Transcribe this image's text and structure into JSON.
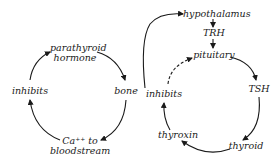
{
  "diagrams": [
    {
      "name": "parathyroid-cycle",
      "nodes": [
        {
          "id": "parathyroid_hormone",
          "line1": "parathyroid",
          "line2": "hormone"
        },
        {
          "id": "bone",
          "line1": "bone"
        },
        {
          "id": "ca_to_bloodstream",
          "line1": "Ca⁺⁺ to",
          "line2": "bloodstream"
        },
        {
          "id": "inhibits",
          "line1": "inhibits"
        }
      ],
      "edges": [
        [
          "parathyroid_hormone",
          "bone"
        ],
        [
          "bone",
          "ca_to_bloodstream"
        ],
        [
          "ca_to_bloodstream",
          "inhibits"
        ],
        [
          "inhibits",
          "parathyroid_hormone"
        ]
      ]
    },
    {
      "name": "thyroid-cycle",
      "nodes": [
        {
          "id": "hypothalamus",
          "line1": "hypothalamus"
        },
        {
          "id": "trh",
          "line1": "TRH"
        },
        {
          "id": "pituitary",
          "line1": "pituitary"
        },
        {
          "id": "tsh",
          "line1": "TSH"
        },
        {
          "id": "thyroid",
          "line1": "thyroid"
        },
        {
          "id": "thyroxin",
          "line1": "thyroxin"
        },
        {
          "id": "inhibits",
          "line1": "inhibits"
        }
      ],
      "edges": [
        [
          "hypothalamus",
          "trh"
        ],
        [
          "trh",
          "pituitary"
        ],
        [
          "pituitary",
          "tsh"
        ],
        [
          "tsh",
          "thyroid"
        ],
        [
          "thyroid",
          "thyroxin"
        ],
        [
          "thyroxin",
          "inhibits"
        ],
        [
          "inhibits",
          "pituitary",
          "dashed"
        ],
        [
          "inhibits",
          "hypothalamus"
        ]
      ]
    }
  ]
}
